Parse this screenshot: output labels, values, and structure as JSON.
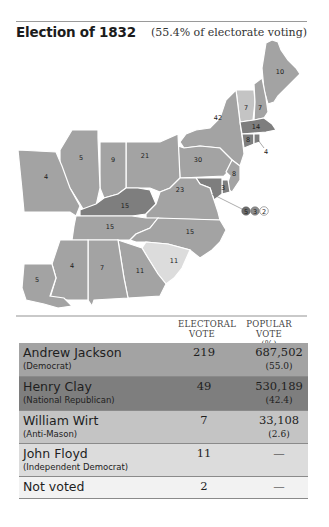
{
  "header": {
    "title": "Election of 1832",
    "subtitle": "(55.4% of electorate voting)"
  },
  "colors": {
    "jackson": "#a3a3a3",
    "clay": "#7e7e7e",
    "wirt": "#c4c4c4",
    "floyd": "#dcdcdc",
    "not_voted": "#f2f2f2"
  },
  "map": {
    "state_labels": [
      {
        "state": "Maine",
        "value": "10"
      },
      {
        "state": "Vermont",
        "value": "7"
      },
      {
        "state": "New Hampshire",
        "value": "7"
      },
      {
        "state": "New York",
        "value": "42"
      },
      {
        "state": "Massachusetts",
        "value": "14"
      },
      {
        "state": "Connecticut",
        "value": "8"
      },
      {
        "state": "Rhode Island",
        "value": "4"
      },
      {
        "state": "Pennsylvania",
        "value": "30"
      },
      {
        "state": "New Jersey",
        "value": "8"
      },
      {
        "state": "Delaware",
        "value": "3"
      },
      {
        "state": "Ohio",
        "value": "21"
      },
      {
        "state": "Indiana",
        "value": "9"
      },
      {
        "state": "Illinois",
        "value": "5"
      },
      {
        "state": "Missouri",
        "value": "4"
      },
      {
        "state": "Kentucky",
        "value": "15"
      },
      {
        "state": "Virginia",
        "value": "23"
      },
      {
        "state": "Tennessee",
        "value": "15"
      },
      {
        "state": "North Carolina",
        "value": "15"
      },
      {
        "state": "South Carolina",
        "value": "11"
      },
      {
        "state": "Georgia",
        "value": "11"
      },
      {
        "state": "Alabama",
        "value": "7"
      },
      {
        "state": "Mississippi",
        "value": "4"
      },
      {
        "state": "Louisiana",
        "value": "5"
      }
    ],
    "maryland_split": [
      "5",
      "3",
      "2"
    ]
  },
  "table": {
    "columns": {
      "electoral_line1": "ELECTORAL",
      "electoral_line2": "VOTE",
      "popular_line1": "POPULAR VOTE",
      "popular_line2": "(%)"
    },
    "rows": [
      {
        "name": "Andrew Jackson",
        "party": "(Democrat)",
        "electoral": "219",
        "popular": "687,502",
        "percent": "(55.0)"
      },
      {
        "name": "Henry Clay",
        "party": "(National Republican)",
        "electoral": "49",
        "popular": "530,189",
        "percent": "(42.4)"
      },
      {
        "name": "William Wirt",
        "party": "(Anti-Mason)",
        "electoral": "7",
        "popular": "33,108",
        "percent": "(2.6)"
      },
      {
        "name": "John Floyd",
        "party": "(Independent Democrat)",
        "electoral": "11",
        "popular": "—",
        "percent": ""
      },
      {
        "name": "Not voted",
        "party": "",
        "electoral": "2",
        "popular": "—",
        "percent": ""
      }
    ]
  }
}
